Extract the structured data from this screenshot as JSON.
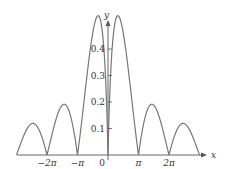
{
  "chart_data": {
    "type": "line",
    "title": "",
    "xlabel": "x",
    "ylabel": "y",
    "x_ticks": [
      "−2π",
      "−π",
      "0",
      "π",
      "2π"
    ],
    "x_tick_values": [
      -6.2832,
      -3.1416,
      0,
      3.1416,
      6.2832
    ],
    "y_ticks": [
      "0.1",
      "0.2",
      "0.3",
      "0.4"
    ],
    "y_tick_values": [
      0.1,
      0.2,
      0.3,
      0.4
    ],
    "xlim": [
      -9.4,
      9.4
    ],
    "ylim": [
      0,
      0.48
    ],
    "grid": false,
    "series": [
      {
        "name": "curve",
        "description": "arch-shaped curve with zeros at multiples of π, peaks decreasing away from origin",
        "x": [
          -9.42,
          -7.85,
          -6.28,
          -4.71,
          -3.14,
          -1.9,
          0,
          1.9,
          3.14,
          4.71,
          6.28,
          7.85,
          9.42
        ],
        "values": [
          0,
          0.12,
          0,
          0.2,
          0,
          0.35,
          0,
          0.35,
          0,
          0.2,
          0,
          0.12,
          0
        ]
      }
    ]
  }
}
